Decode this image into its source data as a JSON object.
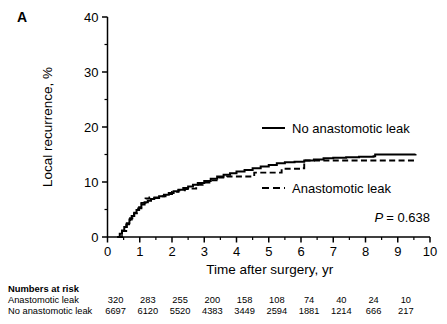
{
  "panel": {
    "label": "A"
  },
  "chart_data": {
    "type": "line",
    "title": "",
    "xlabel": "Time after surgery, yr",
    "ylabel": "Local recurrence, %",
    "xlim": [
      0,
      10
    ],
    "ylim": [
      0,
      40
    ],
    "xticks": [
      0,
      1,
      2,
      3,
      4,
      5,
      6,
      7,
      8,
      9,
      10
    ],
    "xtick_labels": [
      "0",
      "1",
      "2",
      "3",
      "4",
      "5",
      "6",
      "7",
      "8",
      "9",
      "10"
    ],
    "yticks": [
      0,
      10,
      20,
      30,
      40
    ],
    "ytick_labels": [
      "0",
      "10",
      "20",
      "30",
      "40"
    ],
    "yminor": [
      5,
      15,
      25,
      35
    ],
    "xminor": [
      0.5,
      1.5,
      2.5,
      3.5,
      4.5,
      5.5,
      6.5,
      7.5,
      8.5,
      9.5
    ],
    "grid": false,
    "legend_position": "right",
    "annotation": {
      "p_symbol": "P",
      "p_text": "= 0.638",
      "p_value": 0.638
    },
    "series": [
      {
        "name": "No anastomotic leak",
        "style": "solid",
        "color": "#000000",
        "legend_label": "No anastomotic leak",
        "points": [
          [
            0.3,
            0.0
          ],
          [
            0.38,
            0.6
          ],
          [
            0.45,
            1.2
          ],
          [
            0.52,
            1.8
          ],
          [
            0.6,
            2.5
          ],
          [
            0.68,
            3.2
          ],
          [
            0.75,
            3.8
          ],
          [
            0.83,
            4.4
          ],
          [
            0.9,
            4.9
          ],
          [
            0.98,
            5.4
          ],
          [
            1.05,
            5.9
          ],
          [
            1.15,
            6.3
          ],
          [
            1.25,
            6.6
          ],
          [
            1.35,
            6.9
          ],
          [
            1.45,
            7.1
          ],
          [
            1.6,
            7.4
          ],
          [
            1.75,
            7.7
          ],
          [
            1.9,
            8.0
          ],
          [
            2.05,
            8.3
          ],
          [
            2.2,
            8.6
          ],
          [
            2.35,
            8.9
          ],
          [
            2.5,
            9.2
          ],
          [
            2.65,
            9.5
          ],
          [
            2.8,
            9.8
          ],
          [
            3.0,
            10.2
          ],
          [
            3.2,
            10.6
          ],
          [
            3.4,
            11.0
          ],
          [
            3.6,
            11.3
          ],
          [
            3.8,
            11.6
          ],
          [
            4.0,
            11.9
          ],
          [
            4.25,
            12.2
          ],
          [
            4.5,
            12.5
          ],
          [
            4.75,
            12.8
          ],
          [
            5.0,
            13.1
          ],
          [
            5.25,
            13.4
          ],
          [
            5.5,
            13.6
          ],
          [
            5.8,
            13.7
          ],
          [
            6.1,
            13.9
          ],
          [
            6.4,
            14.1
          ],
          [
            6.7,
            14.3
          ],
          [
            7.0,
            14.4
          ],
          [
            7.4,
            14.5
          ],
          [
            7.8,
            14.6
          ],
          [
            8.25,
            14.7
          ],
          [
            8.3,
            15.0
          ],
          [
            9.0,
            15.0
          ],
          [
            9.55,
            15.1
          ]
        ]
      },
      {
        "name": "Anastomotic leak",
        "style": "dashed",
        "color": "#000000",
        "legend_label": "Anastomotic leak",
        "points": [
          [
            0.32,
            0.0
          ],
          [
            0.45,
            1.1
          ],
          [
            0.58,
            2.3
          ],
          [
            0.7,
            3.4
          ],
          [
            0.82,
            4.3
          ],
          [
            0.95,
            5.2
          ],
          [
            1.05,
            6.2
          ],
          [
            1.18,
            7.0
          ],
          [
            1.3,
            7.2
          ],
          [
            1.45,
            7.2
          ],
          [
            1.6,
            7.4
          ],
          [
            1.8,
            7.8
          ],
          [
            2.0,
            8.2
          ],
          [
            2.2,
            8.5
          ],
          [
            2.4,
            8.7
          ],
          [
            2.55,
            8.8
          ],
          [
            2.75,
            9.5
          ],
          [
            2.95,
            9.9
          ],
          [
            3.2,
            10.3
          ],
          [
            3.45,
            10.8
          ],
          [
            3.7,
            11.0
          ],
          [
            4.0,
            11.0
          ],
          [
            4.4,
            11.0
          ],
          [
            4.55,
            11.7
          ],
          [
            5.0,
            11.7
          ],
          [
            5.3,
            11.7
          ],
          [
            5.4,
            12.4
          ],
          [
            5.9,
            12.4
          ],
          [
            6.05,
            12.5
          ],
          [
            6.1,
            13.9
          ],
          [
            6.6,
            13.9
          ],
          [
            7.2,
            13.9
          ],
          [
            8.0,
            13.9
          ],
          [
            9.0,
            13.9
          ],
          [
            9.55,
            13.9
          ]
        ]
      }
    ]
  },
  "risk_table": {
    "title": "Numbers at risk",
    "rows": [
      {
        "label": "Anastomotic leak",
        "values": [
          "320",
          "283",
          "255",
          "200",
          "158",
          "108",
          "74",
          "40",
          "24",
          "10"
        ]
      },
      {
        "label": "No anastomotic leak",
        "values": [
          "6697",
          "6120",
          "5520",
          "4383",
          "3449",
          "2594",
          "1881",
          "1214",
          "666",
          "217"
        ]
      }
    ],
    "value_positions": [
      0,
      1,
      2,
      3,
      4,
      5,
      6,
      7,
      8,
      9
    ]
  }
}
